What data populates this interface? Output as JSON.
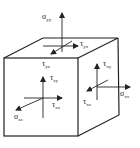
{
  "diagram": {
    "title": "",
    "type": "stress-element-cube",
    "colors": {
      "stroke": "#222222",
      "background": "#ffffff"
    },
    "labels": {
      "top_normal": {
        "symbol": "σ",
        "sub": "yy"
      },
      "top_shear": {
        "symbol": "τ",
        "sub": "yx"
      },
      "top_shear2": {
        "symbol": "τ",
        "sub": "yz"
      },
      "front_normal": {
        "symbol": "σ",
        "sub": "zz"
      },
      "front_shear_y": {
        "symbol": "τ",
        "sub": "zy"
      },
      "front_shear_x": {
        "symbol": "τ",
        "sub": "zx"
      },
      "right_normal": {
        "symbol": "σ",
        "sub": "xx"
      },
      "right_shear_y": {
        "symbol": "τ",
        "sub": "xy"
      },
      "right_shear_z": {
        "symbol": "τ",
        "sub": "xz"
      }
    }
  }
}
